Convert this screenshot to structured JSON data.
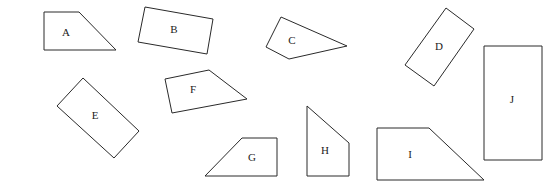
{
  "diagram": {
    "stroke_color": "#2a2a2a",
    "fill_color": "#ffffff",
    "shapes": [
      {
        "id": "A",
        "label": "A",
        "type": "trapezoid",
        "points": [
          [
            44,
            12
          ],
          [
            79,
            12
          ],
          [
            116,
            50
          ],
          [
            44,
            50
          ]
        ],
        "label_pos": [
          66,
          33
        ]
      },
      {
        "id": "B",
        "label": "B",
        "type": "rectangle-rotated",
        "points": [
          [
            145,
            7
          ],
          [
            213,
            19
          ],
          [
            207,
            54
          ],
          [
            138,
            42
          ]
        ],
        "label_pos": [
          174,
          30
        ]
      },
      {
        "id": "C",
        "label": "C",
        "type": "quadrilateral",
        "points": [
          [
            281,
            17
          ],
          [
            347,
            46
          ],
          [
            289,
            59
          ],
          [
            266,
            47
          ]
        ],
        "label_pos": [
          292,
          41
        ]
      },
      {
        "id": "D",
        "label": "D",
        "type": "rectangle-rotated",
        "points": [
          [
            446,
            8
          ],
          [
            474,
            29
          ],
          [
            434,
            86
          ],
          [
            405,
            65
          ]
        ],
        "label_pos": [
          439,
          47
        ]
      },
      {
        "id": "E",
        "label": "E",
        "type": "rectangle-rotated",
        "points": [
          [
            83,
            78
          ],
          [
            139,
            131
          ],
          [
            114,
            158
          ],
          [
            57,
            106
          ]
        ],
        "label_pos": [
          95,
          116
        ]
      },
      {
        "id": "F",
        "label": "F",
        "type": "quadrilateral",
        "points": [
          [
            165,
            79
          ],
          [
            209,
            70
          ],
          [
            247,
            99
          ],
          [
            172,
            113
          ]
        ],
        "label_pos": [
          193,
          90
        ]
      },
      {
        "id": "G",
        "label": "G",
        "type": "trapezoid",
        "points": [
          [
            242,
            138
          ],
          [
            277,
            138
          ],
          [
            277,
            176
          ],
          [
            205,
            176
          ]
        ],
        "label_pos": [
          252,
          158
        ]
      },
      {
        "id": "H",
        "label": "H",
        "type": "trapezoid",
        "points": [
          [
            307,
            106
          ],
          [
            349,
            143
          ],
          [
            349,
            176
          ],
          [
            307,
            176
          ]
        ],
        "label_pos": [
          325,
          151
        ]
      },
      {
        "id": "I",
        "label": "I",
        "type": "trapezoid",
        "points": [
          [
            377,
            128
          ],
          [
            429,
            128
          ],
          [
            484,
            180
          ],
          [
            377,
            180
          ]
        ],
        "label_pos": [
          410,
          155
        ]
      },
      {
        "id": "J",
        "label": "J",
        "type": "rectangle",
        "points": [
          [
            484,
            46
          ],
          [
            542,
            46
          ],
          [
            542,
            160
          ],
          [
            484,
            160
          ]
        ],
        "label_pos": [
          512,
          100
        ]
      }
    ]
  }
}
